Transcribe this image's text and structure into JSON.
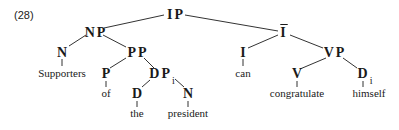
{
  "example_number": "(28)",
  "tree": {
    "nodes": {
      "ip": "IP",
      "np": "NP",
      "ibar": "I",
      "n1": "N",
      "pp": "PP",
      "i": "I",
      "vp": "VP",
      "p": "P",
      "dp": "DP",
      "dp_index": "i",
      "v": "V",
      "d2": "D",
      "d2_index": "i",
      "d1": "D",
      "n2": "N"
    },
    "leaves": {
      "supporters": "Supporters",
      "of": "of",
      "the": "the",
      "president": "president",
      "can": "can",
      "congratulate": "congratulate",
      "himself": "himself"
    }
  }
}
